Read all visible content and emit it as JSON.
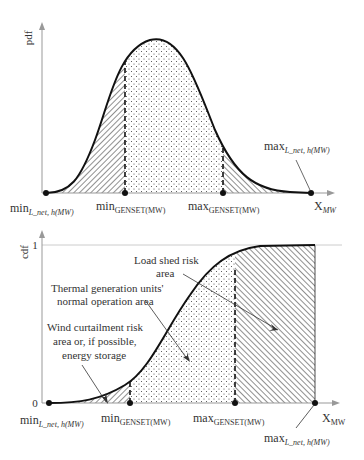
{
  "top_chart": {
    "y_axis_label": "pdf",
    "x_axis_label": "X",
    "x_axis_sub": "MW",
    "markers": {
      "min_l_net": {
        "main": "min",
        "sub": "L_net, h(MW)"
      },
      "min_genset": {
        "main": "min",
        "sub": "GENSET(MW)"
      },
      "max_genset": {
        "main": "max",
        "sub": "GENSET(MW)"
      },
      "max_l_net": {
        "main": "max",
        "sub": "L_net, h(MW)"
      }
    }
  },
  "bottom_chart": {
    "y_axis_label": "cdf",
    "y_tick_top": "1",
    "y_tick_bottom": "0",
    "x_axis_label": "X",
    "x_axis_sub": "MW",
    "markers": {
      "min_l_net": {
        "main": "min",
        "sub": "L_net, h(MW)"
      },
      "min_genset": {
        "main": "min",
        "sub": "GENSET(MW)"
      },
      "max_genset": {
        "main": "max",
        "sub": "GENSET(MW)"
      },
      "max_l_net": {
        "main": "max",
        "sub": "L_net, h(MW)"
      }
    },
    "annotations": {
      "load_shed_line1": "Load shed risk",
      "load_shed_line2": "area",
      "thermal_line1": "Thermal generation units'",
      "thermal_line2": "normal operation area",
      "wind_line1": "Wind curtailment risk",
      "wind_line2": "area or, if possible,",
      "wind_line3": "energy storage"
    }
  },
  "colors": {
    "curve": "#111111",
    "axis": "#999999",
    "text": "#333333"
  }
}
